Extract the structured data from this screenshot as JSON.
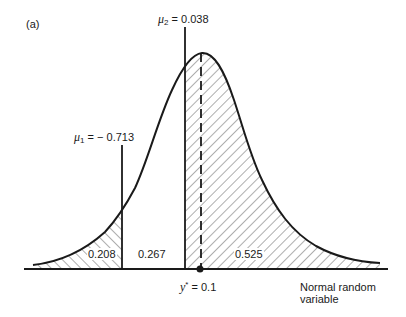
{
  "figure": {
    "panel_label": "(a)",
    "x_axis_label_line1": "Normal random",
    "x_axis_label_line2": "variable",
    "mu1": {
      "symbol": "μ",
      "subscript": "1",
      "equals": " = − ",
      "value": "0.713"
    },
    "mu2": {
      "symbol": "μ",
      "subscript": "2",
      "equals": " = ",
      "value": "0.038"
    },
    "ystar": {
      "symbol": "y",
      "superscript": "*",
      "equals": " = ",
      "value": "0.1"
    },
    "areas": [
      {
        "name": "left-tail",
        "value": "0.208",
        "hatched": true
      },
      {
        "name": "middle",
        "value": "0.267",
        "hatched": false
      },
      {
        "name": "right",
        "value": "0.525",
        "hatched": true
      }
    ],
    "colors": {
      "ink": "#1a1a1a",
      "background": "#ffffff"
    }
  }
}
